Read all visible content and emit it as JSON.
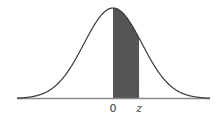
{
  "chart_data": {
    "type": "area",
    "title": "",
    "xlabel": "",
    "ylabel": "",
    "tick_labels": [
      "0",
      "z"
    ],
    "distribution": {
      "name": "standard normal",
      "mean": 0,
      "sd": 1
    },
    "shaded_region": {
      "from": "0",
      "to": "z",
      "z_value_approx": 0.9
    },
    "x_range": [
      -3.3,
      3.3
    ],
    "grid": false,
    "legend": null
  },
  "colors": {
    "curve": "#3a3a3a",
    "shade": "#555555",
    "baseline": "#8a8a8a",
    "background": "#ffffff"
  },
  "geometry": {
    "center_x": 113,
    "peak_y": 8,
    "baseline_y": 98.5,
    "sigma_px": 29,
    "baseline_x_start": 17,
    "baseline_x_end": 210
  }
}
